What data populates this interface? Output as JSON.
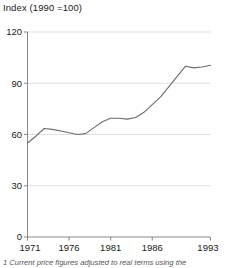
{
  "chart_data": {
    "type": "line",
    "title": "Index (1990 =100)",
    "xlabel": "",
    "ylabel": "",
    "xlim": [
      1971,
      1993
    ],
    "ylim": [
      0,
      120
    ],
    "ytick_labels": [
      "0",
      "30",
      "60",
      "90",
      "120"
    ],
    "yticks": [
      0,
      30,
      60,
      90,
      120
    ],
    "xtick_labels": [
      "1971",
      "1976",
      "1981",
      "1986",
      "1993"
    ],
    "xticks": [
      1971,
      1976,
      1981,
      1986,
      1993
    ],
    "grid": "horizontal",
    "legend": "none",
    "line_color": "#6b6b6b",
    "x": [
      1971,
      1972,
      1973,
      1974,
      1975,
      1976,
      1977,
      1978,
      1979,
      1980,
      1981,
      1982,
      1983,
      1984,
      1985,
      1986,
      1987,
      1988,
      1989,
      1990,
      1991,
      1992,
      1993
    ],
    "values": [
      55,
      59,
      63.5,
      63,
      62,
      61,
      60,
      60.5,
      64,
      67.5,
      69.5,
      69.5,
      69,
      70,
      73,
      77.5,
      82,
      88,
      94,
      100,
      99,
      99.5,
      100.5
    ],
    "series": [
      {
        "name": "Index",
        "values": [
          55,
          59,
          63.5,
          63,
          62,
          61,
          60,
          60.5,
          64,
          67.5,
          69.5,
          69.5,
          69,
          70,
          73,
          77.5,
          82,
          88,
          94,
          100,
          99,
          99.5,
          100.5
        ]
      }
    ]
  },
  "footnote": {
    "text": "1  Current price figures adjusted to real terms using the"
  }
}
